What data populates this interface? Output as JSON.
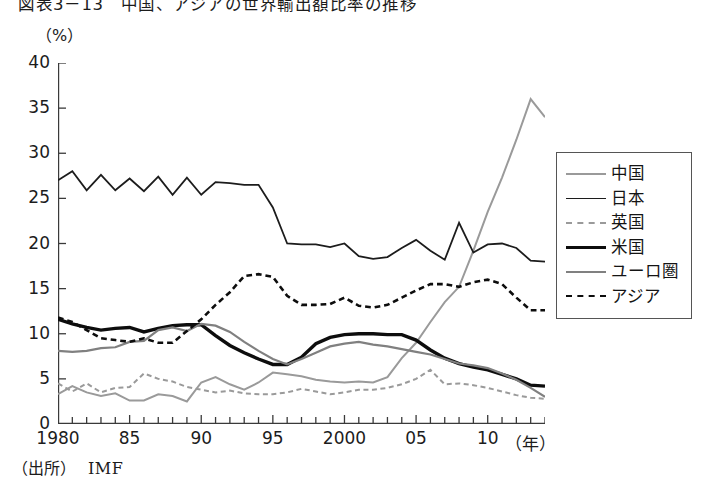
{
  "figure": {
    "title": "図表3－13　中国、アジアの世界輸出額比率の推移",
    "unit_label": "（%）",
    "x_axis_unit": "（年）",
    "source_label": "（出所）",
    "source_value": "IMF"
  },
  "legend": {
    "items": [
      {
        "label": "中国",
        "key": "china",
        "color": "#9a9a9a",
        "width": 2.0,
        "dash": "none"
      },
      {
        "label": "日本",
        "key": "japan",
        "color": "#1c1c1c",
        "width": 1.8,
        "dash": "none"
      },
      {
        "label": "英国",
        "key": "uk",
        "color": "#9a9a9a",
        "width": 2.0,
        "dash": "dashed"
      },
      {
        "label": "米国",
        "key": "usa",
        "color": "#0d0d0d",
        "width": 3.4,
        "dash": "none"
      },
      {
        "label": "ユーロ圏",
        "key": "eurozone",
        "color": "#808080",
        "width": 2.2,
        "dash": "none"
      },
      {
        "label": "アジア",
        "key": "asia",
        "color": "#0d0d0d",
        "width": 2.6,
        "dash": "dashed"
      }
    ]
  },
  "chart_data": {
    "type": "line",
    "title": "図表3－13　中国、アジアの世界輸出額比率の推移",
    "xlabel": "（年）",
    "ylabel": "（%）",
    "xlim": [
      1980,
      2014
    ],
    "ylim": [
      0,
      40
    ],
    "ytick_values": [
      0,
      5,
      10,
      15,
      20,
      25,
      30,
      35,
      40
    ],
    "ytick_labels": [
      "0",
      "5",
      "10",
      "15",
      "20",
      "25",
      "30",
      "35",
      "40"
    ],
    "xtick_values": [
      1980,
      1985,
      1990,
      1995,
      2000,
      2005,
      2010
    ],
    "xtick_labels": [
      "1980",
      "85",
      "90",
      "95",
      "2000",
      "05",
      "10"
    ],
    "xtick_minor_step": 1,
    "grid": false,
    "legend_position": "right-outside",
    "source": "IMF",
    "x": [
      1980,
      1981,
      1982,
      1983,
      1984,
      1985,
      1986,
      1987,
      1988,
      1989,
      1990,
      1991,
      1992,
      1993,
      1994,
      1995,
      1996,
      1997,
      1998,
      1999,
      2000,
      2001,
      2002,
      2003,
      2004,
      2005,
      2006,
      2007,
      2008,
      2009,
      2010,
      2011,
      2012,
      2013,
      2014
    ],
    "series": [
      {
        "name": "中国",
        "key": "china",
        "color": "#9a9a9a",
        "dash": "none",
        "values": [
          3.3,
          4.2,
          3.5,
          3.1,
          3.4,
          2.6,
          2.6,
          3.3,
          3.1,
          2.5,
          4.6,
          5.2,
          4.4,
          3.8,
          4.6,
          5.7,
          5.5,
          5.3,
          4.9,
          4.7,
          4.6,
          4.7,
          4.6,
          5.2,
          7.3,
          9.0,
          11.3,
          13.5,
          15.2,
          19.2,
          23.5,
          27.3,
          31.5,
          36.0,
          34.0
        ]
      },
      {
        "name": "日本",
        "key": "japan",
        "color": "#1c1c1c",
        "dash": "none",
        "values": [
          27.0,
          28.0,
          25.9,
          27.6,
          25.9,
          27.2,
          25.8,
          27.4,
          25.4,
          27.3,
          25.4,
          26.8,
          26.7,
          26.5,
          26.5,
          24.0,
          20.0,
          19.9,
          19.9,
          19.6,
          20.0,
          18.6,
          18.3,
          18.5,
          19.5,
          20.4,
          19.2,
          18.2,
          22.3,
          19.0,
          19.9,
          20.0,
          19.5,
          18.1,
          18.0
        ]
      },
      {
        "name": "英国",
        "key": "uk",
        "color": "#9a9a9a",
        "dash": "dashed",
        "values": [
          4.5,
          3.6,
          4.5,
          3.5,
          4.0,
          4.1,
          5.6,
          5.0,
          4.7,
          4.1,
          3.8,
          3.5,
          3.7,
          3.4,
          3.3,
          3.3,
          3.5,
          3.9,
          3.6,
          3.3,
          3.5,
          3.8,
          3.8,
          4.0,
          4.4,
          5.0,
          6.0,
          4.4,
          4.5,
          4.3,
          4.0,
          3.6,
          3.2,
          2.9,
          2.8
        ]
      },
      {
        "name": "米国",
        "key": "usa",
        "color": "#0d0d0d",
        "dash": "none",
        "values": [
          11.6,
          11.1,
          10.7,
          10.4,
          10.6,
          10.7,
          10.2,
          10.6,
          10.9,
          11.0,
          11.0,
          9.8,
          8.7,
          7.9,
          7.2,
          6.6,
          6.6,
          7.4,
          8.9,
          9.6,
          9.9,
          10.0,
          10.0,
          9.9,
          9.9,
          9.3,
          8.2,
          7.3,
          6.7,
          6.3,
          6.0,
          5.5,
          5.0,
          4.3,
          4.2
        ]
      },
      {
        "name": "ユーロ圏",
        "key": "eurozone",
        "color": "#808080",
        "dash": "none",
        "values": [
          8.1,
          8.0,
          8.1,
          8.4,
          8.5,
          9.1,
          9.2,
          10.4,
          10.7,
          10.3,
          11.1,
          10.9,
          10.2,
          9.1,
          8.1,
          7.2,
          6.6,
          7.2,
          7.9,
          8.6,
          8.9,
          9.1,
          8.8,
          8.6,
          8.3,
          8.0,
          7.7,
          7.2,
          6.7,
          6.5,
          6.2,
          5.6,
          4.9,
          4.0,
          3.0
        ]
      },
      {
        "name": "アジア",
        "key": "asia",
        "color": "#0d0d0d",
        "dash": "dashed",
        "values": [
          11.8,
          11.3,
          10.4,
          9.5,
          9.3,
          9.1,
          9.5,
          9.0,
          9.0,
          10.3,
          11.6,
          13.2,
          14.6,
          16.4,
          16.6,
          16.3,
          14.2,
          13.2,
          13.2,
          13.3,
          14.0,
          13.1,
          12.9,
          13.2,
          14.0,
          14.8,
          15.5,
          15.5,
          15.2,
          15.7,
          16.0,
          15.5,
          14.0,
          12.6,
          12.6
        ]
      }
    ]
  }
}
